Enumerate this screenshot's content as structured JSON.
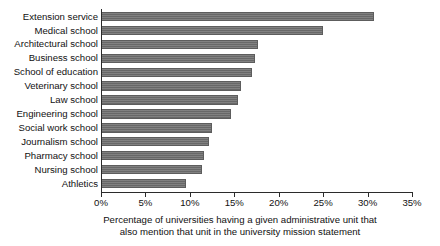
{
  "chart_data": {
    "type": "bar",
    "orientation": "horizontal",
    "title": "",
    "xlabel": "Percentage of universities having a given administrative unit that also mention that unit in the university mission statement",
    "ylabel": "",
    "xlim": [
      0,
      35
    ],
    "xticks": [
      0,
      5,
      10,
      15,
      20,
      25,
      30,
      35
    ],
    "xtick_labels": [
      "0%",
      "5%",
      "10%",
      "15%",
      "20%",
      "25%",
      "30%",
      "35%"
    ],
    "grid": false,
    "legend": null,
    "bar_color": "#6e6e6e",
    "categories": [
      "Extension service",
      "Medical school",
      "Architectural school",
      "Business school",
      "School of education",
      "Veterinary school",
      "Law school",
      "Engineering school",
      "Social work school",
      "Journalism school",
      "Pharmacy school",
      "Nursing school",
      "Athletics"
    ],
    "values": [
      30.7,
      25.0,
      17.7,
      17.3,
      17.0,
      15.8,
      15.4,
      14.6,
      12.5,
      12.1,
      11.6,
      11.4,
      9.6
    ],
    "value_unit": "%"
  },
  "caption": {
    "line1": "Percentage of universities having a given administrative unit that",
    "line2": "also mention that unit in the university mission statement"
  }
}
